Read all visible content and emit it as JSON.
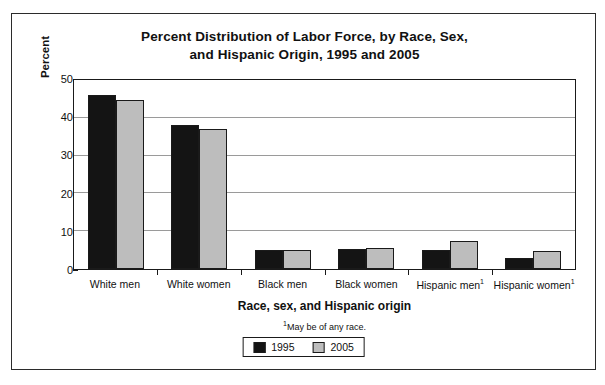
{
  "chart_data": {
    "type": "bar",
    "title": "Percent Distribution of Labor Force, by Race, Sex, and Hispanic Origin, 1995 and 2005",
    "title_line1": "Percent Distribution of Labor Force, by Race, Sex,",
    "title_line2": "and Hispanic Origin, 1995 and 2005",
    "xlabel": "Race, sex, and Hispanic origin",
    "ylabel": "Percent",
    "ylim": [
      0,
      50
    ],
    "ytick_labels": [
      "0",
      "10",
      "20",
      "30",
      "40",
      "50"
    ],
    "yticks": [
      0,
      10,
      20,
      30,
      40,
      50
    ],
    "grid": true,
    "legend_position": "bottom-center",
    "categories": [
      "White men",
      "White women",
      "Black men",
      "Black women",
      "Hispanic men",
      "Hispanic women"
    ],
    "category_footnote_marks": [
      "",
      "",
      "",
      "",
      "1",
      "1"
    ],
    "series": [
      {
        "name": "1995",
        "color": "#141414",
        "values": [
          46.0,
          38.0,
          5.0,
          5.4,
          5.0,
          3.0
        ]
      },
      {
        "name": "2005",
        "color": "#bdbdbd",
        "values": [
          44.6,
          37.0,
          5.0,
          5.5,
          7.5,
          4.7
        ]
      }
    ],
    "footnote": "May be of any race.",
    "footnote_mark": "1"
  },
  "legend": {
    "items": [
      {
        "label": "1995",
        "color": "#141414"
      },
      {
        "label": "2005",
        "color": "#bdbdbd"
      }
    ]
  }
}
